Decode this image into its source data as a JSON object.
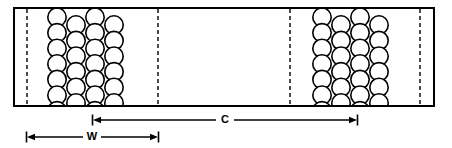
{
  "figure": {
    "title": "",
    "type": "engineering-cross-section-diagram",
    "canvas": {
      "width": 452,
      "height": 148
    },
    "body": {
      "name": "strip-outline",
      "x": 14,
      "y": 8,
      "width": 420,
      "height": 98,
      "stroke": "#000000",
      "stroke_width": 2,
      "fill": "#ffffff"
    },
    "dashed_lines": {
      "stroke": "#000000",
      "stroke_width": 1.4,
      "dash": "4 3",
      "x_positions": [
        27,
        158,
        290,
        420
      ]
    },
    "clusters": [
      {
        "name": "left-coil-pack",
        "x_start": 57,
        "x_end": 127,
        "columns": 4,
        "rows": 7,
        "radius": 9.2,
        "col_spacing": 19.0,
        "row_spacing": 15.6,
        "stroke": "#000000",
        "stroke_width": 1.6,
        "fill": "#ffffff"
      },
      {
        "name": "right-coil-pack",
        "x_start": 322,
        "x_end": 392,
        "columns": 4,
        "rows": 7,
        "radius": 9.2,
        "col_spacing": 19.0,
        "row_spacing": 15.6,
        "stroke": "#000000",
        "stroke_width": 1.6,
        "fill": "#ffffff"
      }
    ],
    "dimensions": [
      {
        "id": "C",
        "label": "C",
        "name": "dimension-c",
        "y": 120,
        "x_from": 93,
        "x_to": 357,
        "label_x": 225,
        "label_y": 120,
        "stroke": "#000000",
        "stroke_width": 1.3,
        "description": "center-to-center spacing between coil packs"
      },
      {
        "id": "W",
        "label": "W",
        "name": "dimension-w",
        "y": 137,
        "x_from": 27,
        "x_to": 158,
        "label_x": 92,
        "label_y": 137,
        "stroke": "#000000",
        "stroke_width": 1.3,
        "description": "width of one repeating section"
      }
    ],
    "colors": {
      "ink": "#000000",
      "paper": "#ffffff"
    }
  }
}
